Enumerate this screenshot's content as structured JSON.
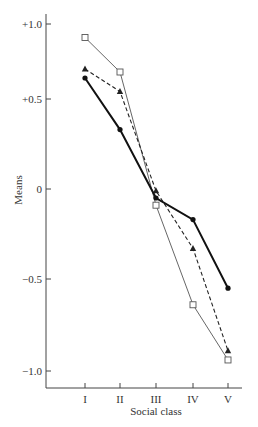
{
  "chart_data": {
    "type": "line",
    "title": "",
    "xlabel": "Social class",
    "ylabel": "Means",
    "categories": [
      "I",
      "II",
      "III",
      "IV",
      "V"
    ],
    "yticks": [
      1.0,
      0.5,
      0,
      -0.5,
      -1.0
    ],
    "ytick_labels": [
      "+1.0",
      "+0.5",
      "0",
      "−0.5",
      "−1.0"
    ],
    "ylim": [
      -1.15,
      1.05
    ],
    "grid": false,
    "legend": null,
    "series": [
      {
        "name": "open-square",
        "marker": "square-open",
        "line": "thin-solid",
        "color": "#555555",
        "values": [
          0.91,
          0.68,
          -0.09,
          -0.64,
          -0.94
        ]
      },
      {
        "name": "filled-triangle",
        "marker": "triangle-filled",
        "line": "dashed",
        "color": "#222222",
        "values": [
          0.7,
          0.55,
          -0.01,
          -0.33,
          -0.89
        ]
      },
      {
        "name": "filled-circle",
        "marker": "circle-filled",
        "line": "thick-solid",
        "color": "#111111",
        "values": [
          0.64,
          0.33,
          -0.05,
          -0.17,
          -0.55
        ]
      }
    ]
  }
}
